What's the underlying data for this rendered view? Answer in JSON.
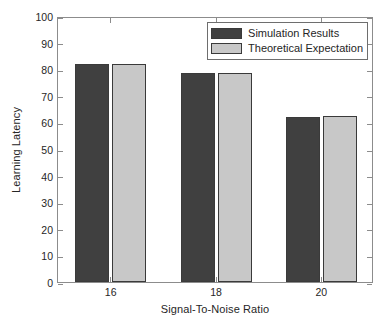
{
  "chart_data": {
    "type": "bar",
    "title": "",
    "subtitle": "",
    "xlabel": "Signal-To-Noise Ratio",
    "ylabel": "Learning Latency",
    "categories": [
      "16",
      "18",
      "20"
    ],
    "series": [
      {
        "name": "Simulation Results",
        "color": "#404040",
        "values": [
          82,
          78.5,
          62
        ]
      },
      {
        "name": "Theoretical Expectation",
        "color": "#c8c8c8",
        "values": [
          82,
          78.5,
          62.3
        ]
      }
    ],
    "ylim": [
      0,
      100
    ],
    "ytick_labels": [
      "0",
      "10",
      "20",
      "30",
      "40",
      "50",
      "60",
      "70",
      "80",
      "90",
      "100"
    ],
    "ytick_values": [
      0,
      10,
      20,
      30,
      40,
      50,
      60,
      70,
      80,
      90,
      100
    ],
    "xtick_labels": [
      "16",
      "18",
      "20"
    ],
    "grid": false,
    "legend_position": "top-right-inside",
    "background_color": "#ffffff",
    "axis_color": "#8c8c8c",
    "bar_edge_color": "#3a3a3a"
  }
}
